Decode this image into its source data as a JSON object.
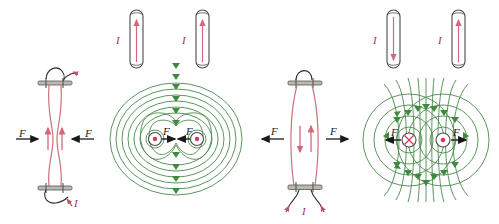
{
  "figure": {
    "background_color": "#ffffff",
    "colors": {
      "field_line": "#4a8a4a",
      "field_arrow": "#3f8a3f",
      "current_red": "#d4667a",
      "current_label": "#a8324a",
      "conductor_outline": "#4a4a4a",
      "wire_red": "#c9727a",
      "force_arrow": "#1a1a1a",
      "terminal_gray": "#8a8a80"
    },
    "labels": {
      "current": "I",
      "force": "F"
    },
    "panels": [
      {
        "id": "panel-1",
        "name": "flexible-parallel-wires-attract",
        "description": "Two flexible vertical wires with parallel currents bow toward each other",
        "current_direction_left": "up",
        "current_direction_right": "up",
        "force_direction": "inward",
        "interaction": "attraction",
        "current_label": "I",
        "force_label_left": "F",
        "force_label_right": "F"
      },
      {
        "id": "panel-2",
        "name": "parallel-rods-field-lines-attract",
        "description": "Two rods with parallel currents out of page, nested oval field lines, forces inward",
        "current_direction_left": "up",
        "current_direction_right": "up",
        "current_symbol_left": "out-of-page",
        "current_symbol_right": "out-of-page",
        "force_direction": "inward",
        "interaction": "attraction",
        "current_label_left": "I",
        "current_label_right": "I",
        "force_label_left": "F",
        "force_label_right": "F"
      },
      {
        "id": "panel-3",
        "name": "flexible-antiparallel-wires-repel",
        "description": "Two flexible vertical wires with opposite currents bow apart",
        "current_direction_left": "down",
        "current_direction_right": "up",
        "force_direction": "outward",
        "interaction": "repulsion",
        "current_label": "I",
        "force_label_left": "F",
        "force_label_right": "F"
      },
      {
        "id": "panel-4",
        "name": "antiparallel-rods-field-lines-repel",
        "description": "Two rods with opposite currents, concentric circular field lines, forces outward",
        "current_direction_left": "down",
        "current_direction_right": "up",
        "current_symbol_left": "into-page",
        "current_symbol_right": "out-of-page",
        "force_direction": "outward",
        "interaction": "repulsion",
        "current_label_left": "I",
        "current_label_right": "I",
        "force_label_left": "F",
        "force_label_right": "F"
      }
    ]
  }
}
